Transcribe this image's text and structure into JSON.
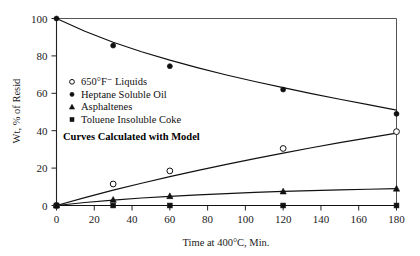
{
  "chart_data": {
    "type": "line",
    "title": "",
    "subtitle": "",
    "xlabel": "Time at 400°C, Min.",
    "ylabel": "Wt, % of Resid",
    "xlim": [
      0,
      180
    ],
    "ylim": [
      0,
      100
    ],
    "xticks": [
      0,
      20,
      40,
      60,
      80,
      100,
      120,
      140,
      160,
      180
    ],
    "xticklabels": [
      "0",
      "20",
      "40",
      "60",
      "80",
      "100",
      "120",
      "140",
      "160",
      "180"
    ],
    "yticks": [
      0,
      20,
      40,
      60,
      80,
      100
    ],
    "yticklabels": [
      "0",
      "20",
      "40",
      "60",
      "80",
      "100"
    ],
    "grid": false,
    "frame": true,
    "legend_position": "upper-left-inside",
    "annotation": "Curves Calculated with Model",
    "series": [
      {
        "name": "650°F⁻ Liquids",
        "marker": "open-circle",
        "x": [
          0,
          30,
          60,
          120,
          180
        ],
        "values": [
          0,
          11.5,
          18.5,
          30.5,
          39.5
        ],
        "curve_x": [
          0,
          15,
          30,
          45,
          60,
          75,
          90,
          105,
          120,
          135,
          150,
          165,
          180
        ],
        "curve_y": [
          0,
          4.2,
          8.2,
          11.9,
          15.4,
          18.8,
          22.0,
          25.1,
          28.0,
          30.9,
          33.6,
          36.2,
          38.7
        ]
      },
      {
        "name": "Heptane Soluble Oil",
        "marker": "filled-circle",
        "x": [
          0,
          30,
          60,
          120,
          180
        ],
        "values": [
          100,
          85.5,
          74.5,
          62.0,
          49.0
        ],
        "curve_x": [
          0,
          15,
          30,
          45,
          60,
          75,
          90,
          105,
          120,
          135,
          150,
          165,
          180
        ],
        "curve_y": [
          100,
          93.2,
          87.3,
          82.2,
          77.7,
          73.6,
          69.8,
          66.3,
          63.0,
          59.8,
          56.8,
          53.9,
          51.0
        ]
      },
      {
        "name": "Asphaltenes",
        "marker": "filled-triangle",
        "x": [
          0,
          30,
          60,
          120,
          180
        ],
        "values": [
          0,
          3.0,
          5.0,
          7.5,
          9.0
        ],
        "curve_x": [
          0,
          15,
          30,
          45,
          60,
          75,
          90,
          105,
          120,
          135,
          150,
          165,
          180
        ],
        "curve_y": [
          0,
          1.6,
          2.9,
          4.0,
          4.9,
          5.7,
          6.4,
          7.0,
          7.5,
          8.0,
          8.4,
          8.7,
          9.0
        ]
      },
      {
        "name": "Toluene Insoluble Coke",
        "marker": "filled-square",
        "x": [
          0,
          30,
          60,
          120,
          180
        ],
        "values": [
          0,
          0.0,
          0.0,
          0.0,
          0.0
        ],
        "curve_x": [
          0,
          180
        ],
        "curve_y": [
          0,
          0
        ]
      }
    ]
  },
  "legend": {
    "items": [
      {
        "marker": "open-circle",
        "label": "650°F⁻ Liquids"
      },
      {
        "marker": "filled-circle",
        "label": "Heptane Soluble Oil"
      },
      {
        "marker": "filled-triangle",
        "label": "Asphaltenes"
      },
      {
        "marker": "filled-square",
        "label": "Toluene Insoluble Coke"
      }
    ],
    "note": "Curves Calculated with Model"
  },
  "colors": {
    "ink": "#111111",
    "frame": "#555555",
    "background": "#ffffff"
  }
}
